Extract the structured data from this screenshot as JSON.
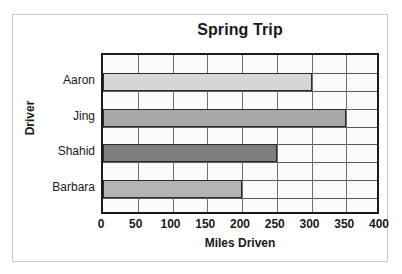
{
  "chart_data": {
    "type": "bar",
    "orientation": "horizontal",
    "title": "Spring Trip",
    "xlabel": "Miles Driven",
    "ylabel": "Driver",
    "categories": [
      "Aaron",
      "Jing",
      "Shahid",
      "Barbara"
    ],
    "values": [
      300,
      350,
      250,
      200
    ],
    "xlim": [
      0,
      400
    ],
    "xticks": [
      0,
      50,
      100,
      150,
      200,
      250,
      300,
      350,
      400
    ],
    "xtick_labels": [
      "0",
      "50",
      "100",
      "150",
      "200",
      "250",
      "300",
      "350",
      "400"
    ],
    "grid": true,
    "grid_axis": "x",
    "legend": false,
    "bar_colors": [
      "#d6d6d6",
      "#a8a8a8",
      "#7e7e7e",
      "#b4b4b4"
    ],
    "bar_edge_color": "#2b2b2b",
    "plot_border_color": "#1a1a1a",
    "gridline_color": "#6f6f6f",
    "frame_color": "#c9c9c9",
    "background_color": "#ffffff",
    "plot_background_color": "#fbfbfb",
    "text_color": "#1a1a1a"
  }
}
